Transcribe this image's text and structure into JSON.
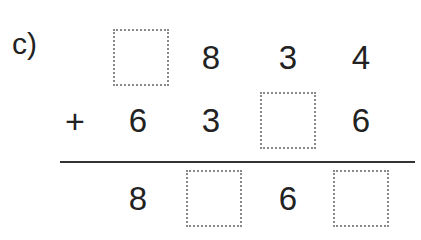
{
  "exercise": {
    "label": "c)",
    "operator": "+",
    "rows": [
      [
        "",
        "8",
        "3",
        "4"
      ],
      [
        "6",
        "3",
        "",
        "6"
      ],
      [
        "8",
        "",
        "6",
        ""
      ]
    ],
    "blanks": [
      {
        "row": 0,
        "col": 0
      },
      {
        "row": 1,
        "col": 2
      },
      {
        "row": 2,
        "col": 1
      },
      {
        "row": 2,
        "col": 3
      }
    ],
    "colors": {
      "text": "#222222",
      "box_border": "#8a8a8a",
      "rule": "#333333"
    }
  }
}
